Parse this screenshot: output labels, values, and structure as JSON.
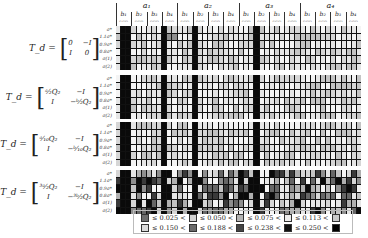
{
  "chart_data": {
    "type": "heatmap",
    "title": "",
    "column_groups": [
      "a1",
      "a2",
      "a3",
      "a4"
    ],
    "column_subgroups": [
      "b1",
      "b2",
      "b3",
      "b4"
    ],
    "subcolumn_labels": [
      "c1",
      "c2",
      "c3"
    ],
    "row_labels": [
      "σ*",
      "1.1σ*",
      "0.9σ*",
      "0.8σ*",
      "σ(1)",
      "σ(2)"
    ],
    "panels": [
      {
        "label_lhs": "Td =",
        "matrix": [
          [
            "0",
            "−I"
          ],
          [
            "I",
            "0"
          ]
        ]
      },
      {
        "label_lhs": "Td =",
        "matrix": [
          [
            "ᵃ⁄₂Q₂",
            "−I"
          ],
          [
            "I",
            "−ᵇ⁄₂Q₂"
          ]
        ]
      },
      {
        "label_lhs": "Td =",
        "matrix": [
          [
            "ᵃ⁄₁₀Q₂",
            "−I"
          ],
          [
            "I",
            "−ᵇ⁄₁₀Q₂"
          ]
        ]
      },
      {
        "label_lhs": "Td =",
        "matrix": [
          [
            "³ᵃ⁄₂Q₂",
            "−I"
          ],
          [
            "I",
            "−³ᵇ⁄₂Q₂"
          ]
        ]
      }
    ],
    "legend": {
      "bins": [
        "≤ 0.025 <",
        "≤ 0.050 <",
        "≤ 0.075 <",
        "≤ 0.113 <",
        "≤ 0.150 <",
        "≤ 0.188 <",
        "≤ 0.238 <",
        "≤ 0.250 <"
      ],
      "colors": [
        "#7a7a7a",
        "#d9d9d9",
        "#b3b3b3",
        "#f2f2f2",
        "#cfcfcf",
        "#5a5a5a",
        "#333333",
        "#0a0a0a",
        "#000000"
      ]
    },
    "level_colors": [
      "#f4f4f4",
      "#e6e6e6",
      "#d6d6d6",
      "#c4c4c4",
      "#b0b0b0",
      "#8e8e8e",
      "#666666",
      "#3a3a3a",
      "#0a0a0a"
    ]
  },
  "header": {
    "a": [
      "a₁",
      "a₂",
      "a₃",
      "a₄"
    ],
    "b": [
      "b₁",
      "b₂",
      "b₃",
      "b₄"
    ],
    "c": "c₁c₂c₃"
  },
  "rows": [
    "σ*",
    "1.1σ*",
    "0.9σ*",
    "0.8σ*",
    "σ(1)",
    "σ(2)"
  ],
  "eq_lhs": "T_d = ",
  "legend_row1": [
    "≤ 0.025 <",
    "≤ 0.050 <",
    "≤ 0.075 <",
    "≤ 0.113 <"
  ],
  "legend_row2": [
    "≤ 0.150 <",
    "≤ 0.188 <",
    "≤ 0.238 <",
    "≤ 0.250 <"
  ]
}
